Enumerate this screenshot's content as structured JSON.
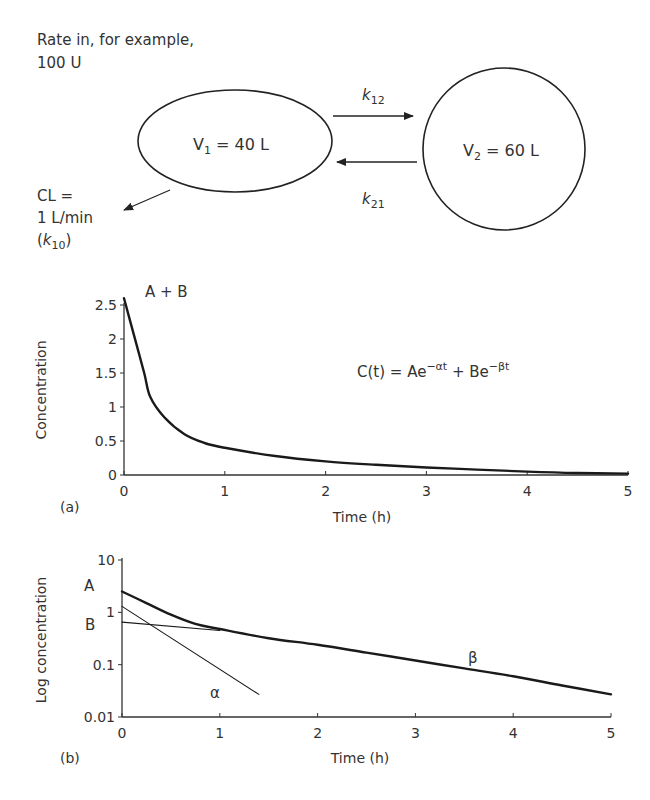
{
  "diagram": {
    "rate_in_line1": "Rate in, for example,",
    "rate_in_line2": "100 U",
    "compartment1": {
      "label": "V",
      "sub": "1",
      "value": " = 40 L"
    },
    "compartment2": {
      "label": "V",
      "sub": "2",
      "value": " = 60 L"
    },
    "k12": {
      "k": "k",
      "sub": "12"
    },
    "k21": {
      "k": "k",
      "sub": "21"
    },
    "clearance_line1": "CL =",
    "clearance_line2": "1 L/min",
    "clearance_line3_open": "(",
    "clearance_k": "k",
    "clearance_sub": "10",
    "clearance_line3_close": ")"
  },
  "panel_a": {
    "label": "(a)",
    "curve_label": "A + B",
    "equation": {
      "lhs": "C(t) = Ae",
      "exp1": "−αt",
      "mid": " + Be",
      "exp2": "−βt"
    }
  },
  "panel_b": {
    "label": "(b)",
    "label_A": "A",
    "label_B": "B",
    "label_alpha": "α",
    "label_beta": "β"
  },
  "chart_data": [
    {
      "type": "line",
      "title": "",
      "xlabel": "Time (h)",
      "ylabel": "Concentration",
      "xlim": [
        0,
        5
      ],
      "ylim": [
        0,
        2.5
      ],
      "xticks": [
        "0",
        "1",
        "2",
        "3",
        "4",
        "5"
      ],
      "yticks": [
        "0",
        "0.5",
        "1",
        "1.5",
        "2",
        "2.5"
      ],
      "grid": false,
      "annotations": [
        "A + B",
        "C(t) = Ae^(−αt) + Be^(−βt)"
      ],
      "series": [
        {
          "name": "C(t)",
          "x": [
            0,
            0.1,
            0.2,
            0.26,
            0.4,
            0.6,
            0.8,
            1.0,
            1.5,
            2.0,
            2.5,
            3.0,
            3.5,
            4.0,
            4.5,
            5.0
          ],
          "values": [
            2.6,
            2.05,
            1.5,
            1.15,
            0.85,
            0.6,
            0.47,
            0.4,
            0.28,
            0.2,
            0.15,
            0.11,
            0.08,
            0.05,
            0.03,
            0.02
          ]
        }
      ]
    },
    {
      "type": "line",
      "title": "",
      "xlabel": "Time (h)",
      "ylabel": "Log concentration",
      "yscale": "log",
      "xlim": [
        0,
        5
      ],
      "ylim": [
        0.01,
        10
      ],
      "xticks": [
        "0",
        "1",
        "2",
        "3",
        "4",
        "5"
      ],
      "yticks": [
        "0.01",
        "0.1",
        "1",
        "10"
      ],
      "grid": false,
      "annotations": [
        "A",
        "B",
        "α",
        "β"
      ],
      "series": [
        {
          "name": "C(t) (total)",
          "x": [
            0,
            0.25,
            0.5,
            0.75,
            1.0,
            1.5,
            2.0,
            2.5,
            3.0,
            3.5,
            4.0,
            4.5,
            5.0
          ],
          "values": [
            2.5,
            1.5,
            0.9,
            0.6,
            0.48,
            0.32,
            0.24,
            0.17,
            0.12,
            0.085,
            0.06,
            0.04,
            0.027
          ]
        },
        {
          "name": "α phase (A e^(−αt))",
          "x": [
            0,
            1.4
          ],
          "values": [
            1.3,
            0.027
          ]
        },
        {
          "name": "β phase back-extrapolation (B e^(−βt))",
          "x": [
            0,
            1.0
          ],
          "values": [
            0.65,
            0.45
          ]
        }
      ]
    }
  ]
}
